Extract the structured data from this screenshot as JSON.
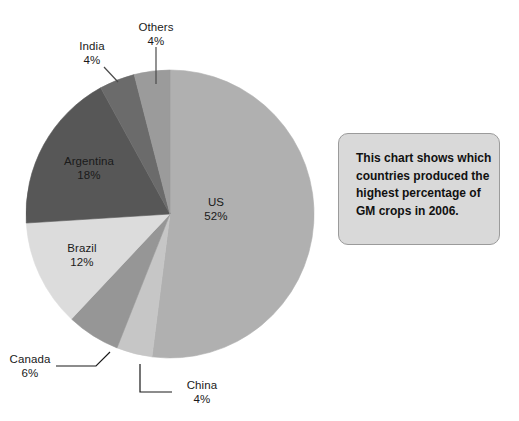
{
  "chart_data": {
    "type": "pie",
    "title": "",
    "subtitle": "",
    "xlabel": "",
    "ylabel": "",
    "legend_position": "none",
    "grid": false,
    "value_unit": "%",
    "start_angle_deg": 0,
    "direction": "clockwise",
    "categories": [
      "US",
      "China",
      "Canada",
      "Brazil",
      "Argentina",
      "India",
      "Others"
    ],
    "values": [
      52,
      4,
      6,
      12,
      18,
      4,
      4
    ],
    "slices": [
      {
        "name": "US",
        "value": 52,
        "label": "US",
        "value_label": "52%",
        "color": "#b0b0b0",
        "label_placement": "inside",
        "leader_line": false
      },
      {
        "name": "China",
        "value": 4,
        "label": "China",
        "value_label": "4%",
        "color": "#c6c6c6",
        "label_placement": "outside",
        "leader_line": true
      },
      {
        "name": "Canada",
        "value": 6,
        "label": "Canada",
        "value_label": "6%",
        "color": "#969696",
        "label_placement": "outside",
        "leader_line": true
      },
      {
        "name": "Brazil",
        "value": 12,
        "label": "Brazil",
        "value_label": "12%",
        "color": "#dcdcdc",
        "label_placement": "inside",
        "leader_line": false
      },
      {
        "name": "Argentina",
        "value": 18,
        "label": "Argentina",
        "value_label": "18%",
        "color": "#575757",
        "label_placement": "inside",
        "leader_line": false
      },
      {
        "name": "India",
        "value": 4,
        "label": "India",
        "value_label": "4%",
        "color": "#6b6b6b",
        "label_placement": "outside",
        "leader_line": true
      },
      {
        "name": "Others",
        "value": 4,
        "label": "Others",
        "value_label": "4%",
        "color": "#9b9b9b",
        "label_placement": "outside",
        "leader_line": true
      }
    ]
  },
  "labels": {
    "us_name": "US",
    "us_value": "52%",
    "china_name": "China",
    "china_value": "4%",
    "canada_name": "Canada",
    "canada_value": "6%",
    "brazil_name": "Brazil",
    "brazil_value": "12%",
    "argentina_name": "Argentina",
    "argentina_value": "18%",
    "india_name": "India",
    "india_value": "4%",
    "others_name": "Others",
    "others_value": "4%"
  },
  "callout": {
    "text": "This chart shows which countries produced the highest percentage of GM crops in 2006.",
    "background_color": "#d9d9d9",
    "border_color": "#9b9b9b"
  }
}
